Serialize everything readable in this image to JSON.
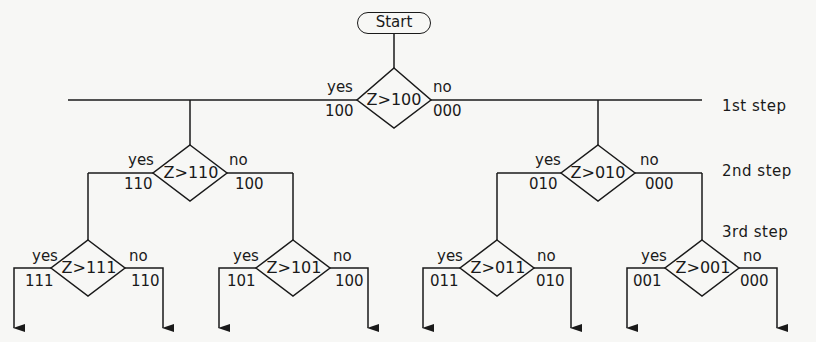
{
  "start": {
    "label": "Start"
  },
  "steps": [
    {
      "label": "1st step"
    },
    {
      "label": "2nd step"
    },
    {
      "label": "3rd step"
    }
  ],
  "branch_labels": {
    "yes": "yes",
    "no": "no"
  },
  "nodes": {
    "n1": {
      "cond": "Z>100",
      "yes_code": "100",
      "no_code": "000"
    },
    "n2a": {
      "cond": "Z>110",
      "yes_code": "110",
      "no_code": "100"
    },
    "n2b": {
      "cond": "Z>010",
      "yes_code": "010",
      "no_code": "000"
    },
    "n3a": {
      "cond": "Z>111",
      "yes_code": "111",
      "no_code": "110"
    },
    "n3b": {
      "cond": "Z>101",
      "yes_code": "101",
      "no_code": "100"
    },
    "n3c": {
      "cond": "Z>011",
      "yes_code": "011",
      "no_code": "010"
    },
    "n3d": {
      "cond": "Z>001",
      "yes_code": "001",
      "no_code": "000"
    }
  }
}
